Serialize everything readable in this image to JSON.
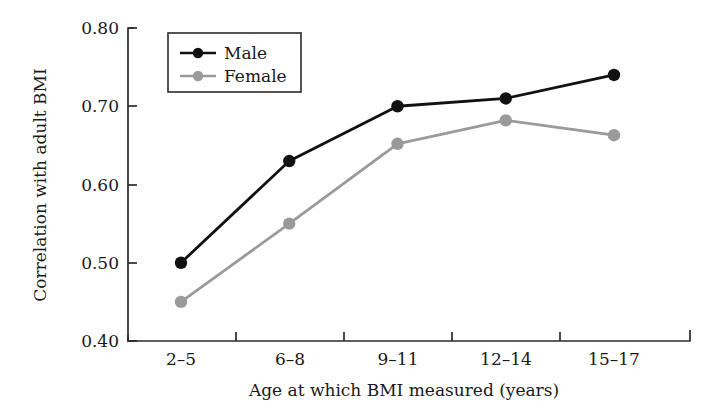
{
  "chart_data": {
    "type": "line",
    "title": "",
    "xlabel": "Age at which BMI measured (years)",
    "ylabel": "Correlation with adult BMI",
    "categories": [
      "2–5",
      "6–8",
      "9–11",
      "12–14",
      "15–17"
    ],
    "ytick_labels": [
      "0.40",
      "0.50",
      "0.60",
      "0.70",
      "0.80"
    ],
    "ytick_values": [
      0.4,
      0.5,
      0.6,
      0.7,
      0.8
    ],
    "ylim": [
      0.4,
      0.8
    ],
    "grid": false,
    "legend_position": "top-left",
    "series": [
      {
        "name": "Male",
        "color": "#111111",
        "marker": "circle",
        "values": [
          0.5,
          0.63,
          0.7,
          0.71,
          0.74
        ]
      },
      {
        "name": "Female",
        "color": "#9a9a9a",
        "marker": "circle",
        "values": [
          0.45,
          0.55,
          0.652,
          0.682,
          0.663
        ]
      }
    ]
  },
  "axes": {
    "y_tick_0": "0.40",
    "y_tick_1": "0.50",
    "y_tick_2": "0.60",
    "y_tick_3": "0.70",
    "y_tick_4": "0.80",
    "x_tick_0": "2–5",
    "x_tick_1": "6–8",
    "x_tick_2": "9–11",
    "x_tick_3": "12–14",
    "x_tick_4": "15–17",
    "x_axis_title": "Age at which BMI measured (years)",
    "y_axis_title": "Correlation with adult BMI"
  },
  "legend": {
    "item_male": "Male",
    "item_female": "Female"
  },
  "colors": {
    "male": "#111111",
    "female": "#9a9a9a",
    "axis": "#2b2b2b",
    "background": "#ffffff"
  }
}
